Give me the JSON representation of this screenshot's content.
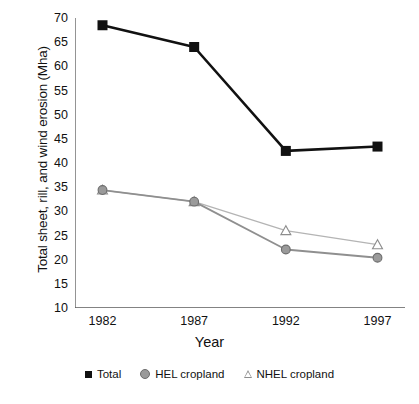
{
  "chart_data": {
    "type": "line",
    "title": "",
    "xlabel": "Year",
    "ylabel": "Total sheet, rill, and wind erosion (Mha)",
    "categories": [
      "1982",
      "1987",
      "1992",
      "1997"
    ],
    "x": [
      1982,
      1987,
      1992,
      1997
    ],
    "xlim": [
      1980.5,
      1998.5
    ],
    "ylim": [
      10,
      70
    ],
    "yticks": [
      10,
      15,
      20,
      25,
      30,
      35,
      40,
      45,
      50,
      55,
      60,
      65,
      70
    ],
    "ytick_labels": [
      "10",
      "15",
      "20",
      "25",
      "30",
      "35",
      "40",
      "45",
      "50",
      "55",
      "60",
      "65",
      "70"
    ],
    "xticks": [
      1982,
      1987,
      1992,
      1997
    ],
    "xtick_labels": [
      "1982",
      "1987",
      "1992",
      "1997"
    ],
    "grid": false,
    "legend_position": "bottom",
    "series": [
      {
        "name": "Total",
        "marker": "filled-square",
        "color": "#111111",
        "values": [
          68.5,
          64.0,
          42.5,
          43.4
        ]
      },
      {
        "name": "HEL cropland",
        "marker": "filled-circle",
        "color": "#8f8f8f",
        "values": [
          34.4,
          32.0,
          22.1,
          20.4
        ]
      },
      {
        "name": "NHEL cropland",
        "marker": "open-triangle",
        "color": "#b4b4b4",
        "values": [
          34.4,
          32.0,
          26.0,
          23.1
        ]
      }
    ]
  },
  "legend": {
    "items": [
      {
        "label": "Total",
        "marker": "square-marker-icon"
      },
      {
        "label": "HEL cropland",
        "marker": "circle-marker-icon"
      },
      {
        "label": "NHEL cropland",
        "marker": "triangle-marker-icon"
      }
    ]
  },
  "axes": {
    "y_title": "Total sheet, rill, and wind erosion (Mha)",
    "x_title": "Year"
  },
  "colors": {
    "total": "#111111",
    "hel": "#8f8f8f",
    "nhel": "#b4b4b4",
    "axis": "#5a5a5a",
    "background": "#ffffff"
  }
}
